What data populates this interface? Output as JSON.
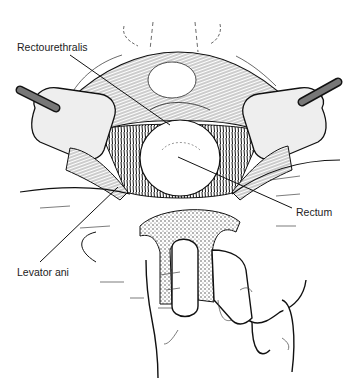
{
  "figure": {
    "type": "surgical-illustration",
    "labels": [
      {
        "id": "rectourethralis",
        "text": "Rectourethralis"
      },
      {
        "id": "rectum",
        "text": "Rectum"
      },
      {
        "id": "levator-ani",
        "text": "Levator ani"
      }
    ]
  }
}
